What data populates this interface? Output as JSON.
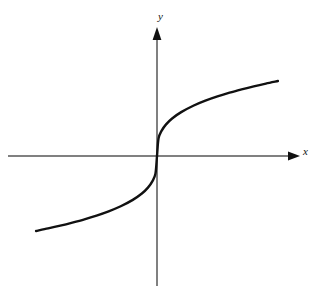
{
  "figure": {
    "background_color": "#ffffff",
    "width": 322,
    "height": 293
  },
  "axes": {
    "x_axis": {
      "label": "x",
      "color": "#808080",
      "line_width": 1,
      "start_x": 8,
      "end_x": 299,
      "y": 156,
      "arrow": "right"
    },
    "y_axis": {
      "label": "y",
      "color": "#808080",
      "line_width": 1,
      "x": 157,
      "start_y": 286,
      "end_y": 28,
      "arrow": "up"
    },
    "origin": {
      "x": 157,
      "y": 156
    }
  },
  "chart_data": {
    "type": "line",
    "title": "",
    "subtitle": "",
    "xlabel": "x",
    "ylabel": "y",
    "grid": false,
    "legend": null,
    "series": [
      {
        "name": "y = x^(1/3)",
        "color": "#111111",
        "line_width": 2.4,
        "x": [
          -4.0,
          -3.6,
          -3.2,
          -2.8,
          -2.4,
          -2.0,
          -1.6,
          -1.2,
          -0.8,
          -0.5,
          -0.3,
          -0.15,
          -0.05,
          0.0,
          0.05,
          0.15,
          0.3,
          0.5,
          0.8,
          1.2,
          1.6,
          2.0,
          2.4,
          2.8,
          3.2,
          3.6,
          4.0
        ],
        "values": [
          -1.587,
          -1.533,
          -1.474,
          -1.409,
          -1.339,
          -1.26,
          -1.17,
          -1.063,
          -0.928,
          -0.794,
          -0.669,
          -0.531,
          -0.368,
          0.0,
          0.368,
          0.531,
          0.669,
          0.794,
          0.928,
          1.063,
          1.17,
          1.26,
          1.339,
          1.409,
          1.474,
          1.533,
          1.587
        ]
      }
    ],
    "xlim": [
      -4.3,
      4.3
    ],
    "ylim": [
      -1.9,
      1.9
    ],
    "annotations": []
  },
  "curve_path": "M 31,228 C 56,220 84,209 106,198 C 126,188 141,176 150,166 C 154,161 156,158 157,156 C 158,154 160,151 164,146 C 173,136 188,124 208,114 C 230,103 258,91 287,81"
}
